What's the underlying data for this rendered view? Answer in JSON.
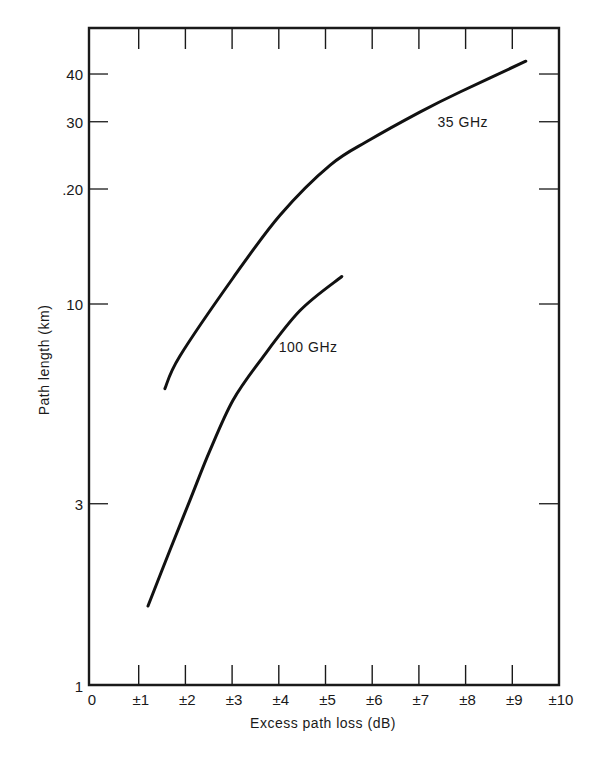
{
  "chart_data": {
    "type": "line",
    "title": "",
    "xlabel": "Excess path loss (dB)",
    "ylabel": "Path length (km)",
    "xlim": [
      0,
      10
    ],
    "ylim": [
      1,
      47
    ],
    "yscale": "log",
    "grid": false,
    "legend": "inline labels",
    "x_ticks": [
      {
        "value": 0,
        "label": "0"
      },
      {
        "value": 1,
        "label": "±1"
      },
      {
        "value": 2,
        "label": "±2"
      },
      {
        "value": 3,
        "label": "±3"
      },
      {
        "value": 4,
        "label": "±4"
      },
      {
        "value": 5,
        "label": "±5"
      },
      {
        "value": 6,
        "label": "±6"
      },
      {
        "value": 7,
        "label": "±7"
      },
      {
        "value": 8,
        "label": "±8"
      },
      {
        "value": 9,
        "label": "±9"
      },
      {
        "value": 10,
        "label": "±10"
      }
    ],
    "y_ticks": [
      {
        "value": 1,
        "label": "1"
      },
      {
        "value": 3,
        "label": "3"
      },
      {
        "value": 10,
        "label": "10"
      },
      {
        "value": 20,
        "label": ".20"
      },
      {
        "value": 30,
        "label": "30"
      },
      {
        "value": 40,
        "label": "40"
      }
    ],
    "series": [
      {
        "name": "35 GHz",
        "label": "35 GHz",
        "x": [
          1.56,
          1.88,
          3.02,
          4.03,
          5.1,
          5.95,
          7.02,
          7.88,
          9.29
        ],
        "y": [
          6.0,
          7.3,
          11.7,
          17.1,
          23.1,
          26.9,
          31.8,
          35.9,
          43.2
        ],
        "label_pos": {
          "x": 7.4,
          "y": 29
        }
      },
      {
        "name": "100 GHz",
        "label": "100 GHz",
        "x": [
          1.2,
          1.67,
          2.1,
          2.53,
          3.02,
          3.6,
          4.45,
          5.35
        ],
        "y": [
          1.62,
          2.27,
          3.07,
          4.15,
          5.6,
          7.1,
          9.6,
          11.8
        ],
        "label_pos": {
          "x": 4.0,
          "y": 7.5
        }
      }
    ]
  }
}
